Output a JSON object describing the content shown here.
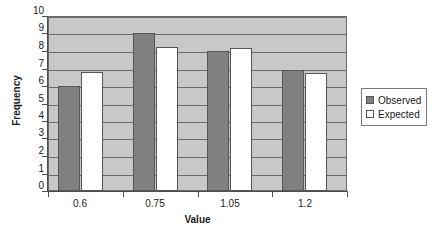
{
  "chart_data": {
    "type": "bar",
    "title": "",
    "xlabel": "Value",
    "ylabel": "Frequency",
    "categories": [
      "0.6",
      "0.75",
      "1.05",
      "1.2"
    ],
    "series": [
      {
        "name": "Observed",
        "color": "#808080",
        "values": [
          6.0,
          9.0,
          8.0,
          6.9
        ]
      },
      {
        "name": "Expected",
        "color": "#ffffff",
        "values": [
          6.8,
          8.2,
          8.15,
          6.75
        ]
      }
    ],
    "ylim": [
      0,
      10
    ],
    "yticks": [
      0,
      1,
      2,
      3,
      4,
      5,
      6,
      7,
      8,
      9,
      10
    ],
    "yticklabels": [
      "0",
      "1",
      "2",
      "3",
      "4",
      "5",
      "6",
      "7",
      "8",
      "9",
      "10"
    ],
    "grid": true,
    "grid_axis": "y",
    "legend_position": "right",
    "plot_background": "#c8c8c8",
    "figure_background": "#ffffff",
    "axis_color": "#4d4d4d"
  }
}
